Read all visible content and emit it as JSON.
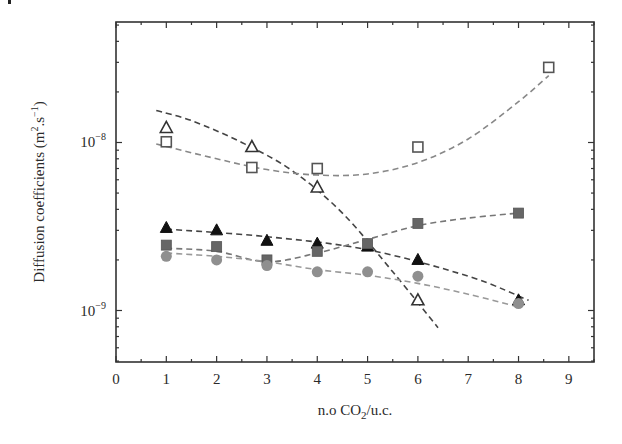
{
  "chart_data": {
    "type": "scatter",
    "title": "",
    "xlabel": "n.o CO2/u.c.",
    "ylabel": "Diffusion coefficients (m2.s-1)",
    "xscale": "linear",
    "yscale": "log",
    "xlim": [
      0,
      9.5
    ],
    "ylim": [
      5e-10,
      5.3e-08
    ],
    "x_ticks": [
      0,
      1,
      2,
      3,
      4,
      5,
      6,
      7,
      8,
      9
    ],
    "y_ticks": [
      {
        "value": 1e-09,
        "label": "10^-9"
      },
      {
        "value": 1e-08,
        "label": "10^-8"
      }
    ],
    "grid": false,
    "legend": null,
    "series": [
      {
        "name": "open-triangle",
        "marker": "triangle-open",
        "color": "#333333",
        "x": [
          1,
          2.7,
          4,
          6
        ],
        "y": [
          1.22e-08,
          9.4e-09,
          5.4e-09,
          1.15e-09
        ],
        "fit": {
          "x": [
            0.8,
            1.5,
            2.5,
            3.5,
            4.5,
            5.5,
            6.4
          ],
          "y": [
            1.55e-08,
            1.35e-08,
            1e-08,
            6.8e-09,
            3.8e-09,
            1.7e-09,
            7.9e-10
          ],
          "color": "#444444"
        }
      },
      {
        "name": "open-square",
        "marker": "square-open",
        "color": "#555555",
        "x": [
          1,
          2.7,
          4,
          6,
          8.6
        ],
        "y": [
          1.01e-08,
          7.1e-09,
          7e-09,
          9.4e-09,
          2.8e-08
        ],
        "fit": {
          "x": [
            0.8,
            2,
            3,
            4,
            5,
            6,
            7,
            8,
            8.6
          ],
          "y": [
            9.8e-09,
            8e-09,
            6.9e-09,
            6.4e-09,
            6.5e-09,
            7.6e-09,
            1.05e-08,
            1.75e-08,
            2.5e-08
          ],
          "color": "#888888"
        }
      },
      {
        "name": "filled-triangle",
        "marker": "triangle-filled",
        "color": "#111111",
        "x": [
          1,
          2,
          3,
          4,
          5,
          6,
          8
        ],
        "y": [
          3.1e-09,
          3e-09,
          2.6e-09,
          2.5e-09,
          2.4e-09,
          2e-09,
          1.15e-09
        ],
        "fit": {
          "x": [
            1,
            3,
            5,
            7,
            8.2
          ],
          "y": [
            3.05e-09,
            2.75e-09,
            2.3e-09,
            1.6e-09,
            1.15e-09
          ],
          "color": "#444444"
        }
      },
      {
        "name": "filled-square",
        "marker": "square-filled",
        "color": "#666666",
        "x": [
          1,
          2,
          3,
          4,
          5,
          6,
          8
        ],
        "y": [
          2.45e-09,
          2.4e-09,
          2e-09,
          2.25e-09,
          2.5e-09,
          3.3e-09,
          3.8e-09
        ],
        "fit": {
          "x": [
            1,
            2,
            3,
            4,
            5,
            6,
            7,
            8
          ],
          "y": [
            2.35e-09,
            2.25e-09,
            1.95e-09,
            2.2e-09,
            2.65e-09,
            3.2e-09,
            3.55e-09,
            3.8e-09
          ],
          "color": "#777777"
        }
      },
      {
        "name": "filled-circle",
        "marker": "circle-filled",
        "color": "#8f8f8f",
        "x": [
          1,
          2,
          3,
          4,
          5,
          6,
          8
        ],
        "y": [
          2.1e-09,
          2e-09,
          1.85e-09,
          1.7e-09,
          1.7e-09,
          1.6e-09,
          1.1e-09
        ],
        "fit": {
          "x": [
            1,
            2,
            3,
            4,
            5,
            6,
            7,
            8
          ],
          "y": [
            2.2e-09,
            2.1e-09,
            1.95e-09,
            1.75e-09,
            1.62e-09,
            1.45e-09,
            1.25e-09,
            1.05e-09
          ],
          "color": "#999999"
        }
      }
    ]
  },
  "axes": {
    "x_title_main": "n.o CO",
    "x_title_sub": "2",
    "x_title_tail": "/u.c.",
    "y_title_main": "Diffusion coefficients (m",
    "y_title_sup1": "2",
    "y_title_mid": ".s",
    "y_title_sup2": "−1",
    "y_title_tail": ")",
    "y_tick_base": "10",
    "y_tick_exp_upper": "−8",
    "y_tick_exp_lower": "−9"
  }
}
